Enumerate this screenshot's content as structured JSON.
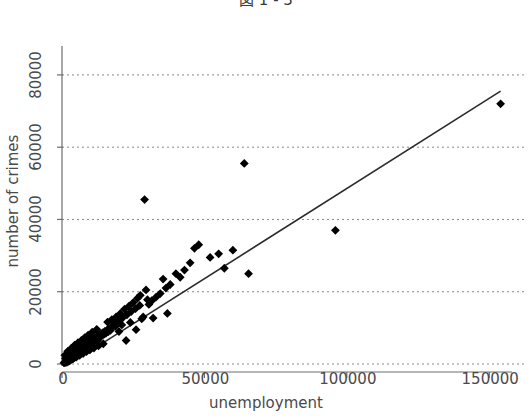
{
  "chart_data": {
    "type": "scatter",
    "title": "図 1 - 3",
    "xlabel": "unemployment",
    "ylabel": "number of crimes",
    "xlim": [
      0,
      158000
    ],
    "ylim": [
      0,
      88000
    ],
    "xticks": [
      0,
      50000,
      100000,
      150000
    ],
    "xtick_labels": [
      "0",
      "50000",
      "100000",
      "150000"
    ],
    "yticks": [
      0,
      20000,
      40000,
      60000,
      80000
    ],
    "ytick_labels": [
      "0",
      "20000",
      "40000",
      "60000",
      "80000"
    ],
    "grid": "horizontal-dotted",
    "legend": null,
    "marker": "filled-diamond",
    "marker_color": "#000000",
    "trendline": {
      "label": "linear fit",
      "color": "#2b2b2b",
      "x": [
        1500,
        154000
      ],
      "y": [
        -600,
        75500
      ]
    },
    "points": [
      [
        700,
        300
      ],
      [
        900,
        500
      ],
      [
        1100,
        400
      ],
      [
        1300,
        700
      ],
      [
        1500,
        600
      ],
      [
        1700,
        900
      ],
      [
        1900,
        800
      ],
      [
        2100,
        1200
      ],
      [
        2300,
        1000
      ],
      [
        2500,
        1400
      ],
      [
        2700,
        1100
      ],
      [
        2900,
        1600
      ],
      [
        3100,
        1300
      ],
      [
        3300,
        1800
      ],
      [
        3500,
        1500
      ],
      [
        3700,
        2100
      ],
      [
        3900,
        1700
      ],
      [
        4100,
        2300
      ],
      [
        4300,
        2000
      ],
      [
        4500,
        2600
      ],
      [
        4700,
        2200
      ],
      [
        4900,
        2900
      ],
      [
        5100,
        2500
      ],
      [
        5300,
        3100
      ],
      [
        5500,
        2700
      ],
      [
        5700,
        3400
      ],
      [
        5900,
        3000
      ],
      [
        6100,
        3700
      ],
      [
        6300,
        3200
      ],
      [
        6500,
        3900
      ],
      [
        6700,
        3500
      ],
      [
        6900,
        4200
      ],
      [
        7100,
        3800
      ],
      [
        7300,
        4500
      ],
      [
        7500,
        4000
      ],
      [
        7700,
        4800
      ],
      [
        7900,
        4300
      ],
      [
        8100,
        5100
      ],
      [
        8300,
        4600
      ],
      [
        8500,
        5400
      ],
      [
        8700,
        4900
      ],
      [
        8900,
        5700
      ],
      [
        9100,
        5200
      ],
      [
        9300,
        6000
      ],
      [
        9500,
        5500
      ],
      [
        9700,
        6300
      ],
      [
        9900,
        5800
      ],
      [
        10200,
        6600
      ],
      [
        10500,
        6100
      ],
      [
        10800,
        6900
      ],
      [
        11100,
        6400
      ],
      [
        11400,
        7200
      ],
      [
        11700,
        6700
      ],
      [
        12000,
        7500
      ],
      [
        12300,
        7000
      ],
      [
        12600,
        7800
      ],
      [
        12900,
        7300
      ],
      [
        13200,
        8100
      ],
      [
        13500,
        7600
      ],
      [
        13800,
        8400
      ],
      [
        14100,
        7900
      ],
      [
        14400,
        8700
      ],
      [
        14700,
        8200
      ],
      [
        15000,
        9000
      ],
      [
        15400,
        8500
      ],
      [
        15800,
        9400
      ],
      [
        16200,
        8900
      ],
      [
        16600,
        9800
      ],
      [
        17000,
        9300
      ],
      [
        17400,
        10200
      ],
      [
        1200,
        1500
      ],
      [
        1800,
        2200
      ],
      [
        2400,
        1900
      ],
      [
        3000,
        2800
      ],
      [
        3600,
        2400
      ],
      [
        4200,
        3300
      ],
      [
        4800,
        3000
      ],
      [
        5400,
        3900
      ],
      [
        6000,
        3600
      ],
      [
        6600,
        4500
      ],
      [
        7200,
        4100
      ],
      [
        7800,
        5000
      ],
      [
        8400,
        4700
      ],
      [
        9000,
        5600
      ],
      [
        9600,
        5300
      ],
      [
        10300,
        6200
      ],
      [
        11000,
        5900
      ],
      [
        11800,
        6800
      ],
      [
        12500,
        6500
      ],
      [
        13300,
        7400
      ],
      [
        1000,
        2400
      ],
      [
        2000,
        3500
      ],
      [
        3200,
        4300
      ],
      [
        4400,
        5200
      ],
      [
        5600,
        5900
      ],
      [
        6800,
        6500
      ],
      [
        8000,
        7300
      ],
      [
        9200,
        8000
      ],
      [
        10600,
        8800
      ],
      [
        12200,
        9600
      ],
      [
        2600,
        900
      ],
      [
        3800,
        1400
      ],
      [
        5000,
        1900
      ],
      [
        6200,
        2400
      ],
      [
        7400,
        2900
      ],
      [
        8600,
        3400
      ],
      [
        9800,
        3900
      ],
      [
        11200,
        4400
      ],
      [
        12800,
        5000
      ],
      [
        14500,
        5600
      ],
      [
        16000,
        11600
      ],
      [
        17500,
        12300
      ],
      [
        18200,
        11000
      ],
      [
        19000,
        13000
      ],
      [
        19800,
        12000
      ],
      [
        20500,
        14000
      ],
      [
        21300,
        12800
      ],
      [
        22000,
        15200
      ],
      [
        22800,
        13600
      ],
      [
        23500,
        16000
      ],
      [
        24300,
        14500
      ],
      [
        25000,
        17000
      ],
      [
        25800,
        15300
      ],
      [
        26500,
        18200
      ],
      [
        27300,
        16200
      ],
      [
        24000,
        11500
      ],
      [
        26000,
        9500
      ],
      [
        28000,
        12500
      ],
      [
        29500,
        20500
      ],
      [
        30500,
        16500
      ],
      [
        22500,
        6500
      ],
      [
        27500,
        19000
      ],
      [
        31500,
        17500
      ],
      [
        33000,
        18500
      ],
      [
        34500,
        19500
      ],
      [
        28500,
        13000
      ],
      [
        32000,
        12700
      ],
      [
        35500,
        23500
      ],
      [
        36500,
        21000
      ],
      [
        38000,
        22000
      ],
      [
        30000,
        17800
      ],
      [
        37000,
        14000
      ],
      [
        40000,
        25000
      ],
      [
        41500,
        24000
      ],
      [
        43000,
        26000
      ],
      [
        45000,
        28000
      ],
      [
        46500,
        32000
      ],
      [
        48000,
        33000
      ],
      [
        52000,
        29500
      ],
      [
        55000,
        30500
      ],
      [
        57000,
        26500
      ],
      [
        60000,
        31500
      ],
      [
        64000,
        55500
      ],
      [
        65500,
        25000
      ],
      [
        96000,
        37000
      ],
      [
        154000,
        72000
      ],
      [
        29000,
        45500
      ],
      [
        18700,
        10400
      ],
      [
        20000,
        9000
      ],
      [
        21000,
        10800
      ]
    ]
  }
}
